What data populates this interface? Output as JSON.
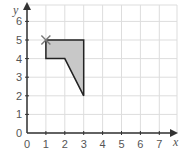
{
  "diagram": {
    "type": "coordinate-grid-shape",
    "x_axis": {
      "label": "x",
      "ticks": [
        "0",
        "1",
        "2",
        "3",
        "4",
        "5",
        "6",
        "7"
      ],
      "range": [
        0,
        7
      ]
    },
    "y_axis": {
      "label": "y",
      "ticks": [
        "0",
        "1",
        "2",
        "3",
        "4",
        "5",
        "6"
      ],
      "range": [
        0,
        6
      ]
    },
    "shape": {
      "vertices": [
        [
          1,
          5
        ],
        [
          3,
          5
        ],
        [
          3,
          2
        ],
        [
          2,
          4
        ],
        [
          1,
          4
        ]
      ],
      "fill": "#c8c8c8",
      "stroke": "#222222"
    },
    "marker": {
      "type": "cross",
      "at": [
        1,
        5
      ],
      "color": "#777777"
    },
    "grid_color": "#dddddd",
    "axis_color": "#333333"
  }
}
